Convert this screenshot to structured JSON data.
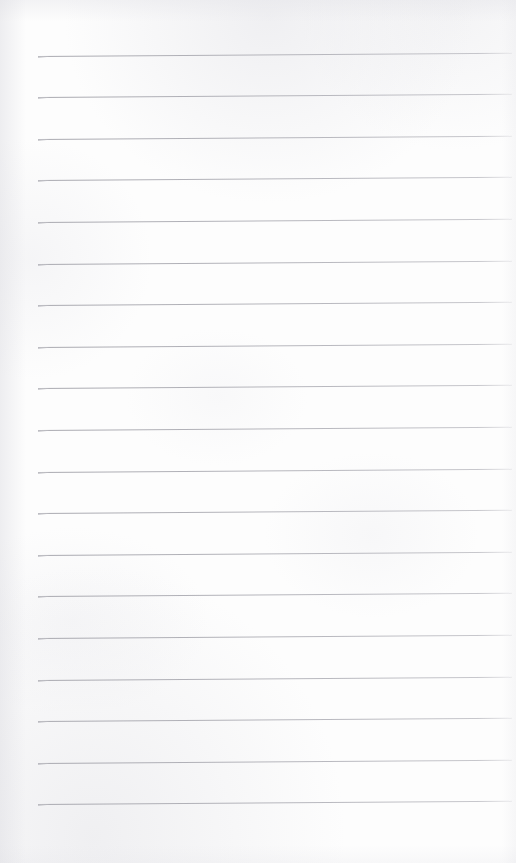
{
  "document": {
    "kind": "scanned-ruled-notepad-page",
    "page_label": "",
    "content_text": "",
    "is_blank": true,
    "background_color": "#fdfdfd",
    "rule_color": "#b0b0b7"
  },
  "canvas": {
    "width": 516,
    "height": 863
  },
  "ruling": {
    "line_count": 19,
    "first_line_y": 55.5,
    "line_spacing": 41.6,
    "line_left_x": 38,
    "line_right_x": 512,
    "line_thickness": 1,
    "skew_degrees": -0.38,
    "bottom_blank_margin": 65,
    "lines": [
      {
        "index": 1,
        "y": 55.5,
        "x1": 38,
        "x2": 512
      },
      {
        "index": 2,
        "y": 97.1,
        "x1": 38,
        "x2": 512
      },
      {
        "index": 3,
        "y": 138.7,
        "x1": 38,
        "x2": 512
      },
      {
        "index": 4,
        "y": 180.3,
        "x1": 38,
        "x2": 512
      },
      {
        "index": 5,
        "y": 221.9,
        "x1": 38,
        "x2": 512
      },
      {
        "index": 6,
        "y": 263.5,
        "x1": 38,
        "x2": 512
      },
      {
        "index": 7,
        "y": 305.1,
        "x1": 38,
        "x2": 512
      },
      {
        "index": 8,
        "y": 346.7,
        "x1": 38,
        "x2": 512
      },
      {
        "index": 9,
        "y": 388.3,
        "x1": 38,
        "x2": 512
      },
      {
        "index": 10,
        "y": 429.9,
        "x1": 38,
        "x2": 512
      },
      {
        "index": 11,
        "y": 471.5,
        "x1": 38,
        "x2": 512
      },
      {
        "index": 12,
        "y": 513.1,
        "x1": 38,
        "x2": 512
      },
      {
        "index": 13,
        "y": 554.7,
        "x1": 38,
        "x2": 512
      },
      {
        "index": 14,
        "y": 596.3,
        "x1": 38,
        "x2": 512
      },
      {
        "index": 15,
        "y": 637.9,
        "x1": 38,
        "x2": 512
      },
      {
        "index": 16,
        "y": 679.5,
        "x1": 38,
        "x2": 512
      },
      {
        "index": 17,
        "y": 721.1,
        "x1": 38,
        "x2": 512
      },
      {
        "index": 18,
        "y": 762.7,
        "x1": 38,
        "x2": 512
      },
      {
        "index": 19,
        "y": 804.3,
        "x1": 38,
        "x2": 512
      }
    ]
  }
}
